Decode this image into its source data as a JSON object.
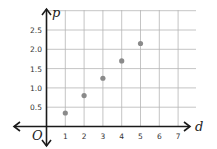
{
  "chart_data": {
    "type": "scatter",
    "title": "",
    "xlabel": "d",
    "ylabel": "p",
    "origin_label": "O",
    "x": [
      1,
      2,
      3,
      4,
      5
    ],
    "y": [
      0.35,
      0.8,
      1.25,
      1.7,
      2.15
    ],
    "series": [
      {
        "name": "points",
        "x": [
          1,
          2,
          3,
          4,
          5
        ],
        "values": [
          0.35,
          0.8,
          1.25,
          1.7,
          2.15
        ]
      }
    ],
    "xticks": [
      "1",
      "2",
      "3",
      "4",
      "5",
      "6",
      "7"
    ],
    "yticks": [
      "0.5",
      "1.0",
      "1.5",
      "2.0",
      "2.5"
    ],
    "xlim": [
      0,
      7.8
    ],
    "ylim": [
      0,
      3.0
    ],
    "grid": true,
    "legend": null,
    "point_color": "#8a8a8a"
  }
}
